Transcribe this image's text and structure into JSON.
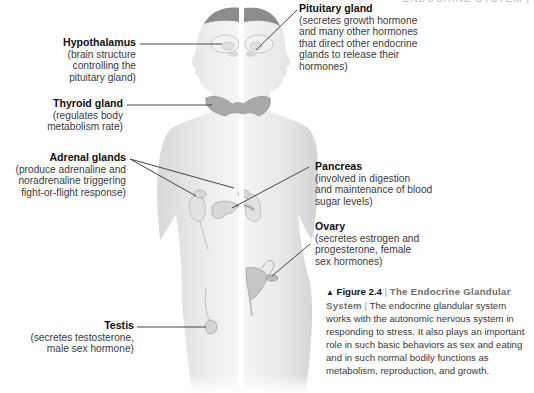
{
  "running_head": "ENDOCRINE SYSTEM |",
  "labels": {
    "hypothalamus": {
      "name": "Hypothalamus",
      "lines": [
        "(brain structure",
        "controlling the",
        "pituitary gland)"
      ]
    },
    "thyroid": {
      "name": "Thyroid gland",
      "lines": [
        "(regulates body",
        "metabolism rate)"
      ]
    },
    "adrenal": {
      "name": "Adrenal glands",
      "lines": [
        "(produce adrenaline and",
        "noradrenaline triggering",
        "fight-or-flight response)"
      ]
    },
    "testis": {
      "name": "Testis",
      "lines": [
        "(secretes testosterone,",
        "male sex hormone)"
      ]
    },
    "pituitary": {
      "name": "Pituitary gland",
      "lines": [
        "(secretes growth hormone",
        "and many other hormones",
        "that direct other endocrine",
        "glands to release their",
        "hormones)"
      ]
    },
    "pancreas": {
      "name": "Pancreas",
      "lines": [
        "(involved in digestion",
        "and maintenance of blood",
        "sugar levels)"
      ]
    },
    "ovary": {
      "name": "Ovary",
      "lines": [
        "(secretes estrogen and",
        "progesterone, female",
        "sex hormones)"
      ]
    }
  },
  "caption": {
    "marker": "▲",
    "figure_number": "Figure 2.4",
    "separator": "|",
    "title": "The Endocrine Glandular System",
    "body": "The endocrine glandular system works with the autonomic nervous system in responding to stress. It also plays an important role in such basic behaviors as sex and eating and in such normal bodily functions as metabolism, reproduction, and growth."
  },
  "colors": {
    "skin_light": "#ececec",
    "skin_shade": "#d4d4d4",
    "hair": "#8c8c8c",
    "gland": "#a9a9a9",
    "leader_line": "#444444"
  }
}
